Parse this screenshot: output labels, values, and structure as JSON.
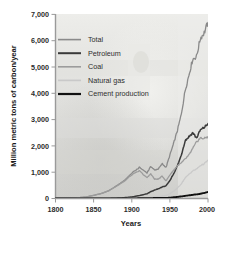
{
  "chart_data": {
    "type": "line",
    "title": "",
    "xlabel": "Years",
    "ylabel": "Million metric tons of carbon/year",
    "xlim": [
      1800,
      2000
    ],
    "ylim": [
      0,
      7000
    ],
    "grid": false,
    "legend_position": "upper-left-inside",
    "xticks": [
      "1800",
      "1850",
      "1900",
      "1950",
      "2000"
    ],
    "xtick_values": [
      1800,
      1850,
      1900,
      1950,
      2000
    ],
    "yticks": [
      "0",
      "1,000",
      "2,000",
      "3,000",
      "4,000",
      "5,000",
      "6,000",
      "7,000"
    ],
    "ytick_values": [
      0,
      1000,
      2000,
      3000,
      4000,
      5000,
      6000,
      7000
    ],
    "x": [
      1800,
      1810,
      1820,
      1830,
      1840,
      1850,
      1860,
      1870,
      1880,
      1890,
      1900,
      1910,
      1920,
      1925,
      1930,
      1935,
      1940,
      1945,
      1950,
      1955,
      1960,
      1965,
      1970,
      1975,
      1980,
      1985,
      1990,
      1995,
      2000
    ],
    "series": [
      {
        "name": "Total",
        "color": "#8a8a8a",
        "values": [
          8,
          12,
          18,
          30,
          55,
          120,
          190,
          300,
          480,
          680,
          960,
          1180,
          980,
          1220,
          1080,
          1130,
          1320,
          1180,
          1650,
          2100,
          2600,
          3200,
          4100,
          4700,
          5300,
          5400,
          6100,
          6300,
          6700
        ]
      },
      {
        "name": "Petroleum",
        "color": "#3a3a3a",
        "values": [
          0,
          0,
          0,
          0,
          0,
          0,
          1,
          3,
          12,
          28,
          60,
          110,
          180,
          260,
          320,
          370,
          440,
          480,
          680,
          950,
          1250,
          1650,
          2200,
          2350,
          2500,
          2300,
          2600,
          2700,
          2850
        ]
      },
      {
        "name": "Coal",
        "color": "#9c9c9c",
        "values": [
          8,
          12,
          18,
          30,
          55,
          120,
          188,
          295,
          465,
          650,
          900,
          1050,
          790,
          940,
          730,
          740,
          850,
          670,
          900,
          1080,
          1250,
          1350,
          1500,
          1650,
          1900,
          2150,
          2300,
          2280,
          2350
        ]
      },
      {
        "name": "Natural gas",
        "color": "#c9c9c9",
        "values": [
          0,
          0,
          0,
          0,
          0,
          0,
          0,
          1,
          3,
          6,
          12,
          20,
          30,
          45,
          60,
          75,
          95,
          120,
          180,
          280,
          400,
          560,
          780,
          920,
          1050,
          1120,
          1250,
          1320,
          1450
        ]
      },
      {
        "name": "Cement production",
        "color": "#111111",
        "values": [
          0,
          0,
          0,
          0,
          0,
          0,
          0,
          0,
          1,
          2,
          4,
          7,
          10,
          14,
          18,
          20,
          24,
          20,
          30,
          45,
          60,
          80,
          100,
          120,
          140,
          155,
          180,
          210,
          250
        ]
      }
    ]
  },
  "legend": {
    "items": [
      {
        "label": "Total",
        "color": "#8a8a8a",
        "weight": 1.6
      },
      {
        "label": "Petroleum",
        "color": "#3a3a3a",
        "weight": 2.0
      },
      {
        "label": "Coal",
        "color": "#9c9c9c",
        "weight": 1.6
      },
      {
        "label": "Natural gas",
        "color": "#c9c9c9",
        "weight": 1.6
      },
      {
        "label": "Cement production",
        "color": "#111111",
        "weight": 2.2
      }
    ]
  },
  "axes": {
    "y_title": "Million metric tons of carbon/year",
    "x_title": "Years"
  },
  "style": {
    "axis_color": "#9a9a9a",
    "plot_background": "#e8e8e6",
    "page_background": "#ffffff"
  }
}
